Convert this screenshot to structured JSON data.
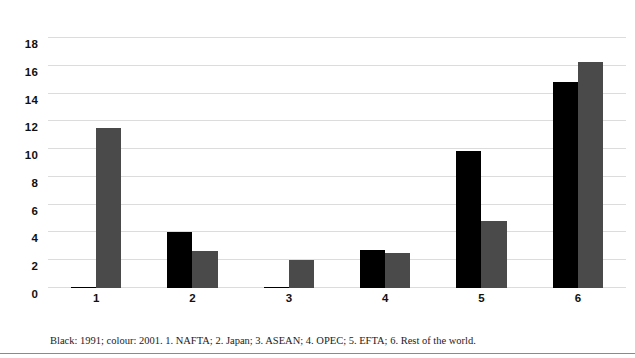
{
  "chart_data": {
    "type": "bar",
    "title": "",
    "subtitle": "",
    "xlabel": "",
    "ylabel": "",
    "grid": true,
    "legend_position": "none",
    "categories": [
      "1",
      "2",
      "3",
      "4",
      "5",
      "6"
    ],
    "ylim": [
      0,
      18
    ],
    "yticks": [
      0,
      2,
      4,
      6,
      8,
      10,
      12,
      14,
      16,
      18
    ],
    "series": [
      {
        "name": "Black: 1991",
        "color": "#000000",
        "values": [
          0.1,
          4.0,
          0.1,
          2.75,
          9.85,
          14.8
        ]
      },
      {
        "name": "colour: 2001",
        "color": "#4a4a4a",
        "values": [
          11.5,
          2.65,
          2.0,
          2.5,
          4.8,
          16.3
        ]
      }
    ],
    "annotations": []
  },
  "caption": {
    "text": "Black: 1991; colour: 2001. 1. NAFTA; 2. Japan; 3. ASEAN; 4. OPEC; 5. EFTA; 6. Rest of the world."
  },
  "category_legend": [
    {
      "number": "1",
      "label": "NAFTA"
    },
    {
      "number": "2",
      "label": "Japan"
    },
    {
      "number": "3",
      "label": "ASEAN"
    },
    {
      "number": "4",
      "label": "OPEC"
    },
    {
      "number": "5",
      "label": "EFTA"
    },
    {
      "number": "6",
      "label": "Rest of the world"
    }
  ],
  "colors": {
    "series_a": "#000000",
    "series_b": "#4a4a4a",
    "gridline": "#dcdcdc",
    "text": "#111111",
    "background": "#ffffff",
    "rule": "#8a8a8a"
  }
}
